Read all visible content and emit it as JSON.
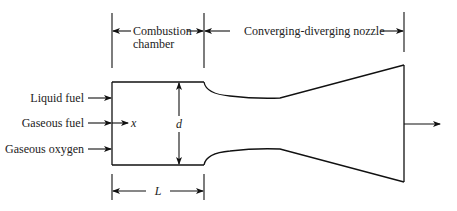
{
  "diagram": {
    "type": "rocket engine schematic",
    "sections": {
      "combustion_chamber": {
        "line1": "Combustion",
        "line2": "chamber"
      },
      "nozzle": {
        "label": "Converging-diverging nozzle"
      }
    },
    "inputs": [
      {
        "label": "Liquid fuel"
      },
      {
        "label": "Gaseous fuel"
      },
      {
        "label": "Gaseous oxygen"
      }
    ],
    "symbols": {
      "axial_coordinate": "x",
      "diameter": "d",
      "length": "L"
    },
    "colors": {
      "stroke": "#111111",
      "background": "#ffffff"
    }
  }
}
